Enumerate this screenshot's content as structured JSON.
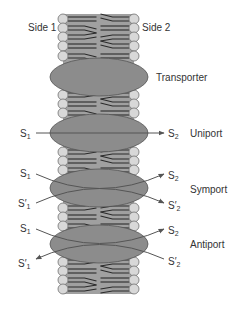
{
  "labels": {
    "side1": "Side 1",
    "side2": "Side 2",
    "transporter": "Transporter",
    "uniport": "Uniport",
    "symport": "Symport",
    "antiport": "Antiport"
  },
  "substrates": {
    "s": "S",
    "s_prime": "S′",
    "sub1": "1",
    "sub2": "2"
  },
  "colors": {
    "membrane_fill": "#a0a0a0",
    "head_fill": "#d8d8d8",
    "head_stroke": "#707070",
    "tail_stroke": "#2a2a2a",
    "protein_fill": "#8c8c8c",
    "protein_stroke": "#555555",
    "arrow_stroke": "#555555",
    "text": "#333333"
  },
  "membrane": {
    "left_x": 63,
    "right_x": 134,
    "head_radius": 5
  },
  "proteins": [
    {
      "name": "transporter",
      "cx": 99,
      "cy": 77,
      "rx": 49,
      "ry": 19
    },
    {
      "name": "uniport",
      "cx": 99,
      "cy": 133,
      "rx": 49,
      "ry": 19
    },
    {
      "name": "symport",
      "cx": 99,
      "cy": 188,
      "rx": 49,
      "ry": 19
    },
    {
      "name": "antiport",
      "cx": 99,
      "cy": 244,
      "rx": 49,
      "ry": 19
    }
  ]
}
